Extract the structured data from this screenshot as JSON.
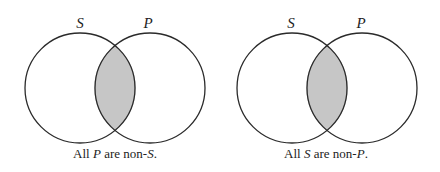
{
  "diagrams": [
    {
      "name": "all-p-are-non-s",
      "circles": [
        {
          "label": "S"
        },
        {
          "label": "P"
        }
      ],
      "shaded_region": "S ∩ P",
      "caption": {
        "parts": [
          {
            "text": "All ",
            "italic": false
          },
          {
            "text": "P",
            "italic": true
          },
          {
            "text": " are non-",
            "italic": false
          },
          {
            "text": "S",
            "italic": true
          },
          {
            "text": ".",
            "italic": false
          }
        ]
      }
    },
    {
      "name": "all-s-are-non-p",
      "circles": [
        {
          "label": "S"
        },
        {
          "label": "P"
        }
      ],
      "shaded_region": "S ∩ P",
      "caption": {
        "parts": [
          {
            "text": "All ",
            "italic": false
          },
          {
            "text": "S",
            "italic": true
          },
          {
            "text": " are non-",
            "italic": false
          },
          {
            "text": "P",
            "italic": true
          },
          {
            "text": ".",
            "italic": false
          }
        ]
      }
    }
  ],
  "colors": {
    "shade": "#c6c6c6",
    "stroke": "#2a2a2a",
    "text": "#222222"
  }
}
